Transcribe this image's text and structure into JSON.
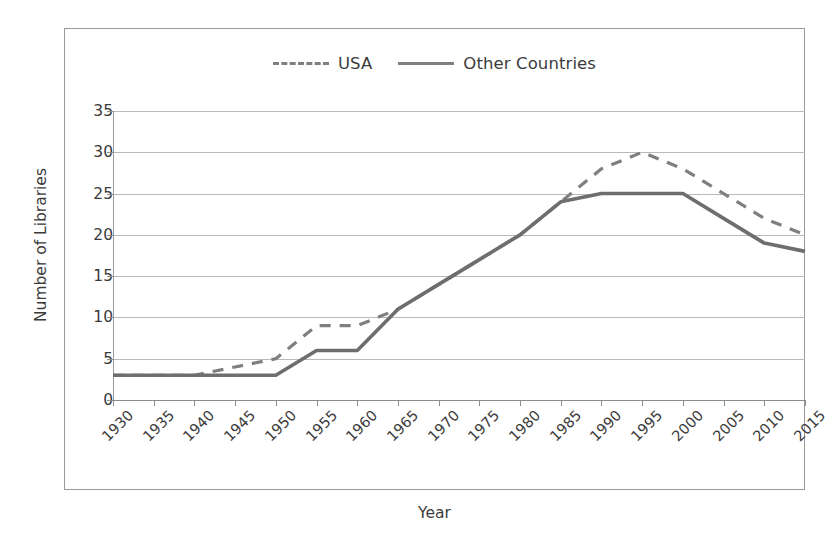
{
  "chart_data": {
    "type": "line",
    "title": "",
    "xlabel": "Year",
    "ylabel": "Number of Libraries",
    "grid": true,
    "legend_position": "top-center",
    "xlim": [
      1930,
      2015
    ],
    "ylim": [
      0,
      35
    ],
    "ytick_step": 5,
    "yticks": [
      0,
      5,
      10,
      15,
      20,
      25,
      30,
      35
    ],
    "ytick_labels": [
      "0",
      "5",
      "10",
      "15",
      "20",
      "25",
      "30",
      "35"
    ],
    "categories": [
      1930,
      1935,
      1940,
      1945,
      1950,
      1955,
      1960,
      1965,
      1970,
      1975,
      1980,
      1985,
      1990,
      1995,
      2000,
      2005,
      2010,
      2015
    ],
    "xtick_labels": [
      "1930",
      "1935",
      "1940",
      "1945",
      "1950",
      "1955",
      "1960",
      "1965",
      "1970",
      "1975",
      "1980",
      "1985",
      "1990",
      "1995",
      "2000",
      "2005",
      "2010",
      "2015"
    ],
    "series": [
      {
        "name": "USA",
        "style": "dashed",
        "color": "#7f7f7f",
        "values": [
          3,
          3,
          3,
          4,
          5,
          9,
          9,
          11,
          14,
          17,
          20,
          24,
          28,
          30,
          28,
          25,
          22,
          20
        ]
      },
      {
        "name": "Other Countries",
        "style": "solid",
        "color": "#6e6e6e",
        "values": [
          3,
          3,
          3,
          3,
          3,
          6,
          6,
          11,
          14,
          17,
          20,
          24,
          25,
          25,
          25,
          22,
          19,
          18
        ]
      }
    ]
  },
  "legend": {
    "items": [
      {
        "label": "USA",
        "style": "dashed"
      },
      {
        "label": "Other Countries",
        "style": "solid"
      }
    ]
  },
  "axes": {
    "x_title": "Year",
    "y_title": "Number of Libraries"
  },
  "colors": {
    "usa_line": "#7f7f7f",
    "other_line": "#6e6e6e",
    "gridline": "#b9b9b9",
    "axis": "#8d8d8d",
    "border": "#9a9a9a",
    "text": "#3b3b3b"
  }
}
